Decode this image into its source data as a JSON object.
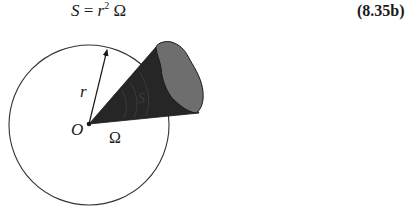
{
  "equation": {
    "lhs": "S",
    "equals": " = ",
    "base": "r",
    "exponent": "2",
    "rhs": " Ω",
    "number": "(8.35b)"
  },
  "diagram": {
    "labels": {
      "radius": "r",
      "origin": "O",
      "solid_angle": "Ω",
      "surface": "S"
    },
    "colors": {
      "cone": "#262626",
      "surface_patch": "#6e6e6e",
      "circle_stroke": "#333333"
    }
  }
}
